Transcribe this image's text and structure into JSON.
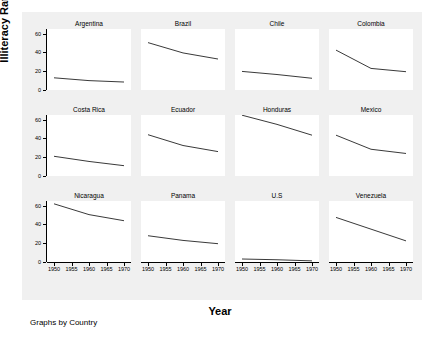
{
  "chart_data": {
    "type": "line",
    "title": "",
    "xlabel": "Year",
    "ylabel": "Illiteracy Rate 14+",
    "note": "Graphs by Country",
    "xlim": [
      1948,
      1972
    ],
    "ylim": [
      0,
      65
    ],
    "xticks": [
      1950,
      1955,
      1960,
      1965,
      1970
    ],
    "xtick_labels": [
      "1950",
      "1955",
      "1960",
      "1965",
      "1970"
    ],
    "yticks": [
      0,
      20,
      40,
      60
    ],
    "ytick_labels": [
      "0",
      "20",
      "40",
      "60"
    ],
    "grid": false,
    "legend": "none",
    "facet_by": "Country",
    "facet_layout": [
      4,
      3
    ],
    "x": [
      1950,
      1960,
      1970
    ],
    "panels": [
      {
        "label": "Argentina",
        "x": [
          1950,
          1960,
          1970
        ],
        "values": [
          13.0,
          10.0,
          8.5
        ]
      },
      {
        "label": "Brazil",
        "x": [
          1950,
          1960,
          1970
        ],
        "values": [
          50.5,
          39.5,
          33.0
        ]
      },
      {
        "label": "Chile",
        "x": [
          1950,
          1960,
          1970
        ],
        "values": [
          19.8,
          16.5,
          12.5
        ]
      },
      {
        "label": "Colombia",
        "x": [
          1950,
          1960,
          1970
        ],
        "values": [
          42.5,
          23.0,
          19.5
        ]
      },
      {
        "label": "Costa Rica",
        "x": [
          1950,
          1960,
          1970
        ],
        "values": [
          21.0,
          15.5,
          11.0
        ]
      },
      {
        "label": "Ecuador",
        "x": [
          1950,
          1960,
          1970
        ],
        "values": [
          44.0,
          32.5,
          26.0
        ]
      },
      {
        "label": "Honduras",
        "x": [
          1950,
          1960,
          1970
        ],
        "values": [
          64.8,
          55.0,
          43.5
        ]
      },
      {
        "label": "Mexico",
        "x": [
          1950,
          1960,
          1970
        ],
        "values": [
          43.5,
          28.5,
          24.0
        ]
      },
      {
        "label": "Nicaragua",
        "x": [
          1950,
          1960,
          1970
        ],
        "values": [
          62.0,
          50.5,
          44.0
        ]
      },
      {
        "label": "Panama",
        "x": [
          1950,
          1960,
          1970
        ],
        "values": [
          28.0,
          23.0,
          19.5
        ]
      },
      {
        "label": "U.S",
        "x": [
          1950,
          1960,
          1970
        ],
        "values": [
          3.2,
          2.4,
          1.2
        ]
      },
      {
        "label": "Venezuela",
        "x": [
          1950,
          1960,
          1970
        ],
        "values": [
          47.5,
          35.0,
          22.5
        ]
      }
    ]
  }
}
